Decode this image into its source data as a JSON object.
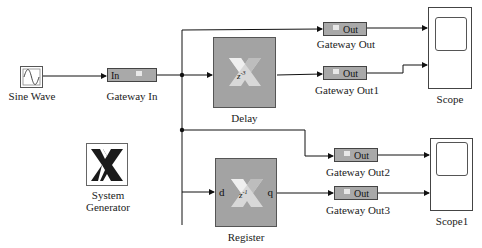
{
  "blocks": {
    "sine_wave": {
      "label": "Sine Wave",
      "icon": "sine-icon"
    },
    "gateway_in": {
      "label": "Gateway In",
      "port": "In"
    },
    "delay": {
      "label": "Delay",
      "expr": "z",
      "exp": "-3"
    },
    "register": {
      "label": "Register",
      "expr": "z",
      "exp": "-1",
      "in_port": "d",
      "out_port": "q"
    },
    "gateway_out": {
      "label": "Gateway Out",
      "port": "Out"
    },
    "gateway_out1": {
      "label": "Gateway Out1",
      "port": "Out"
    },
    "gateway_out2": {
      "label": "Gateway Out2",
      "port": "Out"
    },
    "gateway_out3": {
      "label": "Gateway Out3",
      "port": "Out"
    },
    "scope": {
      "label": "Scope"
    },
    "scope1": {
      "label": "Scope1"
    },
    "system_generator": {
      "label_line1": "System",
      "label_line2": "Generator"
    }
  },
  "colors": {
    "block_gray": "#a3a3a3",
    "gateway_gray": "#a9a9a9",
    "wire": "#111111",
    "logo_light": "#f0f0f0",
    "logo_dark": "#1a1a1a"
  }
}
